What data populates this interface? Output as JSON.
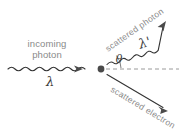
{
  "figure": {
    "background_color": "#ffffff",
    "label_color": "#8a8a8a",
    "line_color": "#333333",
    "dash_color": "#9a9a9a",
    "vertex_color": "#4a4a4a"
  },
  "labels": {
    "incoming_line1": "incoming",
    "incoming_line2": "photon",
    "incoming_wavelength": "λ",
    "scattered_photon": "scattered photon",
    "scattered_wavelength": "λ'",
    "scattered_electron": "scattered electron",
    "angle": "θ"
  },
  "geometry": {
    "vertex": {
      "x": 101,
      "y": 69
    },
    "incoming_photon": {
      "type": "wavy-arrow",
      "start_x": 8,
      "end_x": 90,
      "y": 69,
      "direction_deg": 0
    },
    "reference_axis": {
      "type": "dashed-line",
      "start_x": 106,
      "end_x": 179,
      "y": 69
    },
    "scattered_photon": {
      "type": "wavy-arrow",
      "start_x": 107,
      "start_y": 64,
      "end_x": 166,
      "end_y": 22,
      "direction_deg": -35
    },
    "scattered_electron": {
      "type": "straight-arrow",
      "start_x": 107,
      "start_y": 75,
      "end_x": 168,
      "end_y": 112,
      "direction_deg": 31
    },
    "angle_arc": {
      "center_x": 101,
      "center_y": 69,
      "radius": 19,
      "start_deg": -35,
      "end_deg": 0
    }
  }
}
